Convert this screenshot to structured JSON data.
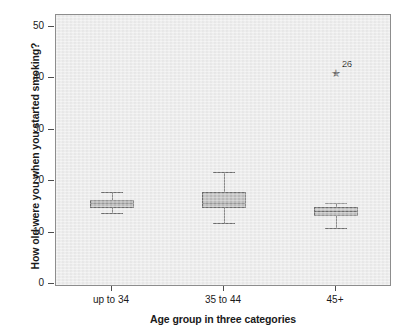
{
  "chart_data": {
    "type": "box",
    "title": "",
    "xlabel": "Age group in three categories",
    "ylabel": "How old were you when you started smoking?",
    "categories": [
      "up to 34",
      "35 to 44",
      "45+"
    ],
    "ylim": [
      0,
      52
    ],
    "yticks": [
      0,
      10,
      20,
      30,
      40,
      50
    ],
    "ytick_labels": [
      "0",
      "10",
      "20",
      "30",
      "40",
      "50"
    ],
    "grid": false,
    "legend": "none",
    "plot_background": "#ededed",
    "box_fill": "#bcbcbc",
    "box_line": "#6e6e6e",
    "boxes": [
      {
        "category": "up to 34",
        "whisker_low": 14,
        "q1": 15,
        "median": 16,
        "q3": 16.6,
        "whisker_high": 18,
        "outliers": []
      },
      {
        "category": "35 to 44",
        "whisker_low": 12,
        "q1": 15,
        "median": 16,
        "q3": 18,
        "whisker_high": 22,
        "outliers": []
      },
      {
        "category": "45+",
        "whisker_low": 11,
        "q1": 13.4,
        "median": 14.4,
        "q3": 15.2,
        "whisker_high": 16,
        "outliers": [
          {
            "value": 41.2,
            "label": "26",
            "marker": "star"
          }
        ]
      }
    ]
  }
}
